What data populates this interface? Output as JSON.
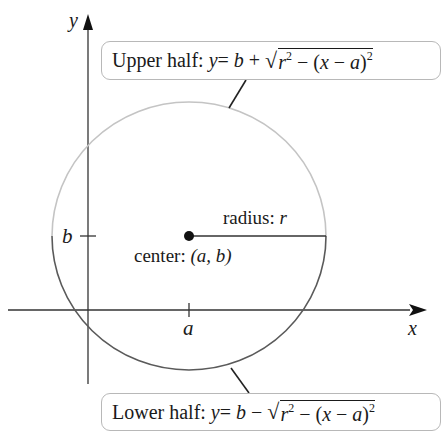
{
  "diagram": {
    "axes": {
      "x_label": "x",
      "y_label": "y",
      "x_tick_label": "a",
      "y_tick_label": "b"
    },
    "center_label": {
      "prefix": "center: ",
      "value": "(a, b)"
    },
    "radius_label": {
      "prefix": "radius: ",
      "value": "r"
    },
    "upper_callout": {
      "prefix": "Upper half: ",
      "lhs": "y",
      "eq": " = ",
      "b": "b",
      "op": " + ",
      "radical": "√",
      "r": "r",
      "exp1": "2",
      "minus": " − (",
      "x": "x",
      "minus2": " − ",
      "a": "a",
      "close": ")",
      "exp2": "2"
    },
    "lower_callout": {
      "prefix": "Lower half: ",
      "lhs": "y",
      "eq": " = ",
      "b": "b",
      "op": " − ",
      "radical": "√",
      "r": "r",
      "exp1": "2",
      "minus": " − (",
      "x": "x",
      "minus2": " − ",
      "a": "a",
      "close": ")",
      "exp2": "2"
    },
    "colors": {
      "upper_arc": "#c4c4c4",
      "lower_arc": "#5a5a5a",
      "axis": "#333333",
      "callout_border": "#b8b8b8"
    }
  }
}
